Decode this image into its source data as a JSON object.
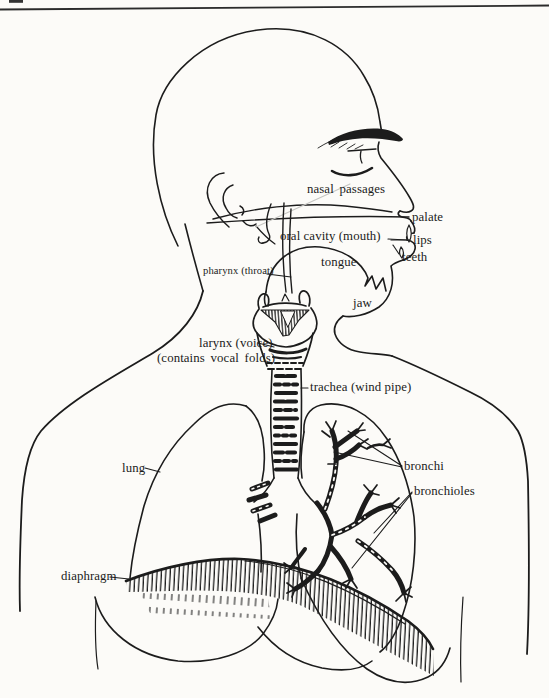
{
  "page": {
    "ink_color": "#1c1c1c",
    "paper_color": "#fcfbf8",
    "top_rule": "horizontal rule across page top",
    "page_edge_mark": "cropped text fragment at top-left edge"
  },
  "diagram": {
    "labels": {
      "nasal_passages": "nasal passages",
      "palate": "palate",
      "lips": "lips",
      "teeth": "teeth",
      "oral_cavity": "oral cavity (mouth)",
      "tongue": "tongue",
      "jaw": "jaw",
      "pharynx": "pharynx (throat)",
      "larynx_line1": "larynx (voice)",
      "larynx_line2": "(contains vocal folds)",
      "trachea": "trachea (wind pipe)",
      "lung": "lung",
      "bronchi": "bronchi",
      "bronchioles": "bronchioles",
      "diaphragm": "diaphragm"
    }
  }
}
